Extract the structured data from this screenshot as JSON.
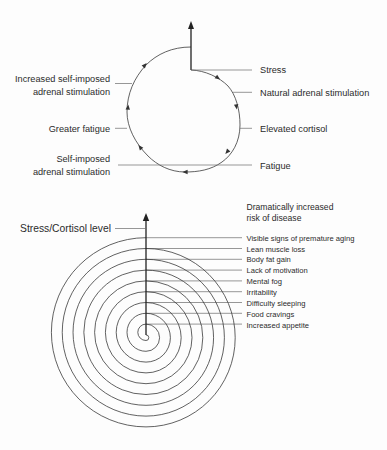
{
  "cycle_diagram": {
    "right_labels": [
      "Stress",
      "Natural adrenal stimulation",
      "Elevated cortisol",
      "Fatigue"
    ],
    "left_labels": [
      {
        "line1": "Increased self-imposed",
        "line2": "adrenal stimulation"
      },
      {
        "line1": "Greater fatigue"
      },
      {
        "line1": "Self-imposed",
        "line2": "adrenal stimulation"
      }
    ]
  },
  "spiral_diagram": {
    "axis_label": "Stress/Cortisol level",
    "top_note": {
      "line1": "Dramatically increased",
      "line2": "risk of disease"
    },
    "levels": [
      "Visible signs of premature aging",
      "Lean muscle loss",
      "Body fat gain",
      "Lack of motivation",
      "Mental fog",
      "Irritability",
      "Difficulty sleeping",
      "Food cravings",
      "Increased appetite"
    ]
  },
  "colors": {
    "background": "#fdfdfd",
    "line": "#3a3a3a",
    "text": "#2b2b2b"
  }
}
